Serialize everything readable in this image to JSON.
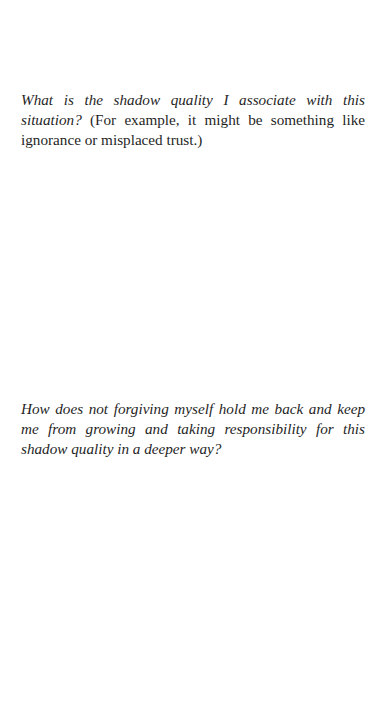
{
  "document": {
    "prompts": [
      {
        "question": "What is the shadow quality I associate with this situation?",
        "note": "(For example, it might be something like ignorance or misplaced trust.)"
      },
      {
        "question": "How does not forgiving myself hold me back and keep me from growing and taking responsibility for this shadow quality in a deeper way?"
      }
    ]
  }
}
